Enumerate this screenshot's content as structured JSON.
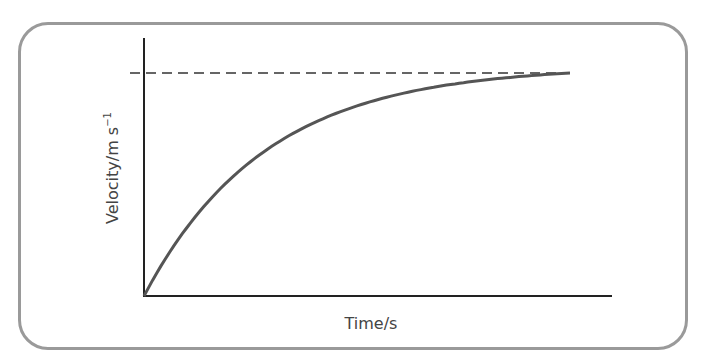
{
  "chart_data": {
    "type": "line",
    "title": "",
    "xlabel": "Time/s",
    "ylabel": "Velocity/m s⁻¹",
    "ylabel_main": "Velocity/m s",
    "ylabel_sup": "−1",
    "x_ticks": [],
    "y_ticks": [],
    "grid": false,
    "legend": null,
    "axis_ranges_normalized": {
      "x": [
        0,
        1.1
      ],
      "y": [
        0,
        1.16
      ]
    },
    "series": [
      {
        "name": "velocity",
        "style": "solid",
        "color": "#555555",
        "description": "Velocity rises from zero and approaches terminal velocity asymptotically (v = v_t(1 - e^(-kt)))",
        "x": [
          0,
          0.1,
          0.2,
          0.3,
          0.4,
          0.5,
          0.6,
          0.7,
          0.8,
          0.9,
          1.0
        ],
        "y": [
          0,
          0.23,
          0.41,
          0.54,
          0.65,
          0.73,
          0.79,
          0.84,
          0.88,
          0.9,
          0.93
        ]
      },
      {
        "name": "terminal velocity",
        "style": "dashed",
        "color": "#333333",
        "description": "Horizontal dashed asymptote at terminal velocity",
        "x": [
          -0.03,
          1.0
        ],
        "y": [
          1.0,
          1.0
        ]
      }
    ]
  },
  "colors": {
    "frame_border": "#9a9a9a",
    "axes": "#222222",
    "curve": "#555555",
    "dashed_line": "#333333",
    "label_text": "#444444"
  }
}
